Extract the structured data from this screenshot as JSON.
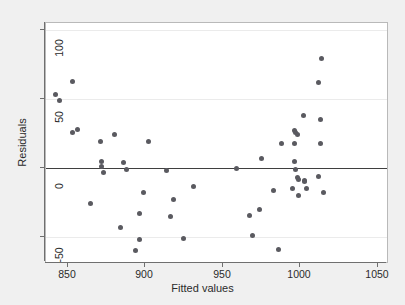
{
  "chart_data": {
    "type": "scatter",
    "title": "",
    "xlabel": "Fitted values",
    "ylabel": "Residuals",
    "xlim": [
      836,
      1056
    ],
    "ylim": [
      -68,
      105
    ],
    "xticks": [
      850,
      900,
      950,
      1000,
      1050
    ],
    "yticks": [
      -50,
      0,
      50,
      100
    ],
    "xtick_labels": [
      "850",
      "900",
      "950",
      "1000",
      "1050"
    ],
    "ytick_labels": [
      "-50",
      "0",
      "50",
      "100"
    ],
    "grid": "horizontal-faint",
    "legend": null,
    "reference_line": {
      "orientation": "horizontal",
      "y": 0,
      "color": "#3f3f3f"
    },
    "marker": {
      "shape": "circle",
      "color": "#5a5a60",
      "size": 5
    },
    "background": {
      "figure": "#f0f0f0",
      "plot": "#ffffff",
      "border": "#b9b9b9"
    },
    "points": [
      {
        "x": 842,
        "y": 53
      },
      {
        "x": 845,
        "y": 49
      },
      {
        "x": 853,
        "y": 63
      },
      {
        "x": 853,
        "y": 26
      },
      {
        "x": 856,
        "y": 28
      },
      {
        "x": 865,
        "y": -26
      },
      {
        "x": 871,
        "y": 19
      },
      {
        "x": 872,
        "y": 5
      },
      {
        "x": 872,
        "y": 1
      },
      {
        "x": 873,
        "y": -3
      },
      {
        "x": 880,
        "y": 24
      },
      {
        "x": 884,
        "y": -43
      },
      {
        "x": 886,
        "y": 4
      },
      {
        "x": 888,
        "y": -1
      },
      {
        "x": 894,
        "y": -60
      },
      {
        "x": 896,
        "y": -33
      },
      {
        "x": 896,
        "y": -52
      },
      {
        "x": 899,
        "y": -18
      },
      {
        "x": 902,
        "y": 19
      },
      {
        "x": 914,
        "y": -2
      },
      {
        "x": 916,
        "y": -35
      },
      {
        "x": 918,
        "y": -23
      },
      {
        "x": 925,
        "y": -51
      },
      {
        "x": 931,
        "y": -13
      },
      {
        "x": 959,
        "y": 0
      },
      {
        "x": 967,
        "y": -34
      },
      {
        "x": 969,
        "y": -49
      },
      {
        "x": 974,
        "y": -30
      },
      {
        "x": 975,
        "y": 7
      },
      {
        "x": 983,
        "y": -16
      },
      {
        "x": 986,
        "y": -59
      },
      {
        "x": 988,
        "y": 18
      },
      {
        "x": 995,
        "y": -15
      },
      {
        "x": 996,
        "y": 27
      },
      {
        "x": 996,
        "y": 18
      },
      {
        "x": 996,
        "y": 5
      },
      {
        "x": 997,
        "y": 26
      },
      {
        "x": 997,
        "y": -1
      },
      {
        "x": 998,
        "y": 24
      },
      {
        "x": 998,
        "y": -7
      },
      {
        "x": 999,
        "y": -8
      },
      {
        "x": 999,
        "y": -20
      },
      {
        "x": 1002,
        "y": 38
      },
      {
        "x": 1003,
        "y": -9
      },
      {
        "x": 1003,
        "y": -10
      },
      {
        "x": 1004,
        "y": -15
      },
      {
        "x": 1012,
        "y": 62
      },
      {
        "x": 1012,
        "y": -6
      },
      {
        "x": 1013,
        "y": 35
      },
      {
        "x": 1013,
        "y": 18
      },
      {
        "x": 1014,
        "y": 79
      },
      {
        "x": 1015,
        "y": -18
      }
    ]
  }
}
